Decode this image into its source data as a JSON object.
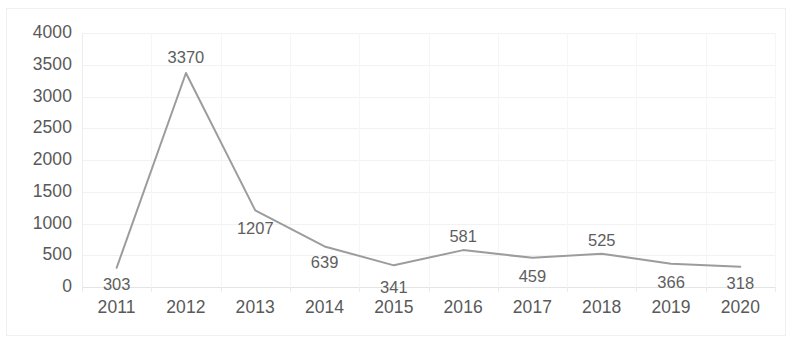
{
  "chart_data": {
    "type": "line",
    "title": "",
    "subtitle": "",
    "xlabel": "",
    "ylabel": "",
    "categories": [
      "2011",
      "2012",
      "2013",
      "2014",
      "2015",
      "2016",
      "2017",
      "2018",
      "2019",
      "2020"
    ],
    "values": [
      303,
      3370,
      1207,
      639,
      341,
      581,
      459,
      525,
      366,
      318
    ],
    "data_labels": [
      "303",
      "3370",
      "1207",
      "639",
      "341",
      "581",
      "459",
      "525",
      "366",
      "318"
    ],
    "ylim": [
      0,
      4000
    ],
    "ytick_labels": [
      "4000",
      "3500",
      "3000",
      "2500",
      "2000",
      "1500",
      "1000",
      "500",
      "0"
    ],
    "ytick_values": [
      4000,
      3500,
      3000,
      2500,
      2000,
      1500,
      1000,
      500,
      0
    ],
    "grid": true,
    "legend": "none",
    "series": [
      {
        "name": "",
        "color": "#9c9c9c",
        "values": [
          303,
          3370,
          1207,
          639,
          341,
          581,
          459,
          525,
          366,
          318
        ]
      }
    ],
    "colors": {
      "line": "#9c9c9c",
      "gridline": "#f2f2f2",
      "axis": "#e4e4e4",
      "tick_text": "#595959",
      "data_label_text": "#5e5e5e",
      "background": "#ffffff",
      "border": "#f0f0f0"
    },
    "label_offsets_px": [
      16,
      -16,
      18,
      16,
      22,
      -14,
      18,
      -14,
      18,
      16
    ]
  }
}
